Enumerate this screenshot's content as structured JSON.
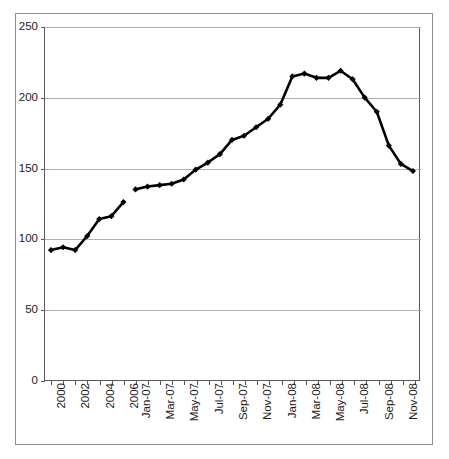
{
  "chart_data": {
    "type": "line",
    "title": "",
    "subtitle": "",
    "xlabel": "",
    "ylabel": "",
    "ylim": [
      0,
      250
    ],
    "yticks": [
      0,
      50,
      100,
      150,
      200,
      250
    ],
    "ytick_labels": [
      "0",
      "50",
      "100",
      "150",
      "200",
      "250"
    ],
    "grid": true,
    "grid_axis": "y",
    "legend": false,
    "legend_position": "none",
    "marker": "diamond",
    "line_color": "#000000",
    "marker_color": "#000000",
    "grid_color": "#b0b0b0",
    "axis_color": "#585858",
    "categories": [
      "2000",
      "2001",
      "2002",
      "2003",
      "2004",
      "2005",
      "2006",
      "Jan-07",
      "Feb-07",
      "Mar-07",
      "Apr-07",
      "May-07",
      "Jun-07",
      "Jul-07",
      "Aug-07",
      "Sep-07",
      "Oct-07",
      "Nov-07",
      "Dec-07",
      "Jan-08",
      "Feb-08",
      "Mar-08",
      "Apr-08",
      "May-08",
      "Jun-08",
      "Jul-08",
      "Aug-08",
      "Sep-08",
      "Oct-08",
      "Nov-08",
      "Dec-08"
    ],
    "xtick_labels_shown": [
      "2000",
      "2002",
      "2004",
      "2006",
      "Jan-07",
      "Mar-07",
      "May-07",
      "Jul-07",
      "Sep-07",
      "Nov-07",
      "Jan-08",
      "Mar-08",
      "May-08",
      "Jul-08",
      "Sep-08",
      "Nov-08"
    ],
    "series": [
      {
        "name": "annual",
        "x": [
          "2000",
          "2001",
          "2002",
          "2003",
          "2004",
          "2005",
          "2006"
        ],
        "values": [
          92,
          94,
          92,
          102,
          114,
          116,
          126
        ]
      },
      {
        "name": "monthly",
        "x": [
          "Jan-07",
          "Feb-07",
          "Mar-07",
          "Apr-07",
          "May-07",
          "Jun-07",
          "Jul-07",
          "Aug-07",
          "Sep-07",
          "Oct-07",
          "Nov-07",
          "Dec-07",
          "Jan-08",
          "Feb-08",
          "Mar-08",
          "Apr-08",
          "May-08",
          "Jun-08",
          "Jul-08",
          "Aug-08",
          "Sep-08",
          "Oct-08",
          "Nov-08",
          "Dec-08"
        ],
        "values": [
          135,
          137,
          138,
          139,
          142,
          149,
          154,
          160,
          170,
          173,
          179,
          185,
          195,
          215,
          217,
          214,
          214,
          219,
          213,
          200,
          190,
          166,
          153,
          148
        ]
      }
    ]
  }
}
